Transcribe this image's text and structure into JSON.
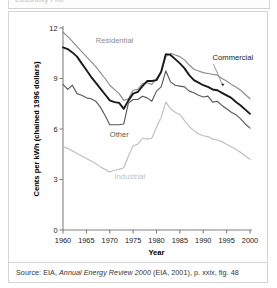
{
  "header": {
    "cut_off_text": "Electricity Pric"
  },
  "caption": {
    "prefix": "Source: EIA, ",
    "italic_title": "Annual Energy Review 2000",
    "suffix": " (EIA, 2001), p. xxix, fig. 48"
  },
  "colors": {
    "commercial": "#1a1a1a",
    "residential": "#8c8c8c",
    "other": "#595959",
    "industrial": "#bfbfbf",
    "axis": "#808080",
    "text": "#1a1a1a",
    "frame": "#d5d5d5"
  },
  "chart_data": {
    "type": "line",
    "title": "",
    "xlabel": "Year",
    "ylabel": "Cents per kWh (chained 1996 dollars)",
    "xlim": [
      1960,
      2000
    ],
    "ylim": [
      0,
      12
    ],
    "xticks": [
      1960,
      1965,
      1970,
      1975,
      1980,
      1985,
      1990,
      1995,
      2000
    ],
    "xticklabels": [
      "1960",
      "1965",
      "1970",
      "1975",
      "1980",
      "1985",
      "1990",
      "1995",
      "2000"
    ],
    "yticks": [
      0,
      3,
      6,
      9,
      12
    ],
    "yticklabels": [
      "0",
      "3",
      "6",
      "9",
      "12"
    ],
    "grid": false,
    "legend": "inline-annotations",
    "x": [
      1960,
      1961,
      1962,
      1963,
      1964,
      1965,
      1966,
      1967,
      1968,
      1969,
      1970,
      1971,
      1972,
      1973,
      1974,
      1975,
      1976,
      1977,
      1978,
      1979,
      1980,
      1981,
      1982,
      1983,
      1984,
      1985,
      1986,
      1987,
      1988,
      1989,
      1990,
      1991,
      1992,
      1993,
      1994,
      1995,
      1996,
      1997,
      1998,
      1999,
      2000
    ],
    "series": [
      {
        "name": "Residential",
        "color": "#8c8c8c",
        "label_x": 1967,
        "label_y": 11.1,
        "values": [
          11.75,
          11.5,
          11.2,
          10.9,
          10.6,
          10.3,
          10.0,
          9.7,
          9.35,
          9.0,
          8.6,
          8.35,
          8.1,
          7.7,
          7.8,
          8.3,
          8.35,
          8.7,
          8.75,
          8.65,
          9.0,
          9.4,
          10.3,
          10.5,
          10.4,
          10.3,
          10.1,
          9.8,
          9.55,
          9.45,
          9.35,
          9.3,
          9.25,
          9.2,
          9.0,
          8.85,
          8.65,
          8.5,
          8.3,
          8.05,
          7.8
        ]
      },
      {
        "name": "Commercial",
        "color": "#1a1a1a",
        "label_x": 1992,
        "label_y": 10.1,
        "values": [
          10.85,
          10.75,
          10.55,
          10.3,
          9.9,
          9.5,
          9.1,
          8.75,
          8.4,
          8.05,
          7.7,
          7.6,
          7.55,
          7.2,
          7.7,
          8.1,
          8.2,
          8.55,
          8.85,
          8.85,
          8.9,
          9.4,
          10.45,
          10.4,
          10.15,
          9.9,
          9.6,
          9.2,
          8.9,
          8.75,
          8.6,
          8.5,
          8.35,
          8.3,
          8.15,
          8.0,
          7.85,
          7.6,
          7.4,
          7.15,
          6.9
        ]
      },
      {
        "name": "Other",
        "color": "#595959",
        "label_x": 1970,
        "label_y": 5.55,
        "values": [
          8.65,
          8.35,
          8.6,
          8.1,
          8.0,
          7.85,
          7.8,
          7.65,
          7.3,
          6.8,
          6.25,
          6.25,
          6.25,
          6.3,
          7.55,
          7.75,
          7.75,
          7.95,
          7.85,
          7.65,
          8.25,
          8.5,
          9.45,
          8.8,
          8.6,
          8.55,
          8.5,
          8.25,
          8.15,
          8.0,
          7.9,
          7.95,
          7.6,
          7.65,
          7.4,
          7.2,
          7.0,
          6.85,
          6.6,
          6.3,
          6.05
        ]
      },
      {
        "name": "Industrial",
        "color": "#bfbfbf",
        "label_x": 1971,
        "label_y": 3.05,
        "values": [
          4.95,
          4.85,
          4.7,
          4.55,
          4.4,
          4.25,
          4.1,
          3.95,
          3.75,
          3.6,
          3.45,
          3.55,
          3.6,
          3.7,
          4.4,
          5.0,
          5.1,
          5.45,
          5.4,
          5.45,
          6.1,
          6.7,
          7.6,
          7.2,
          7.0,
          6.85,
          6.5,
          6.15,
          5.9,
          5.7,
          5.6,
          5.55,
          5.4,
          5.35,
          5.25,
          5.1,
          4.95,
          4.8,
          4.6,
          4.4,
          4.2
        ]
      }
    ],
    "annotations": [
      {
        "name": "commercial-leader-line",
        "from_x": 1992.2,
        "from_y": 9.85,
        "to_x": 1994.2,
        "to_y": 8.55
      }
    ]
  }
}
